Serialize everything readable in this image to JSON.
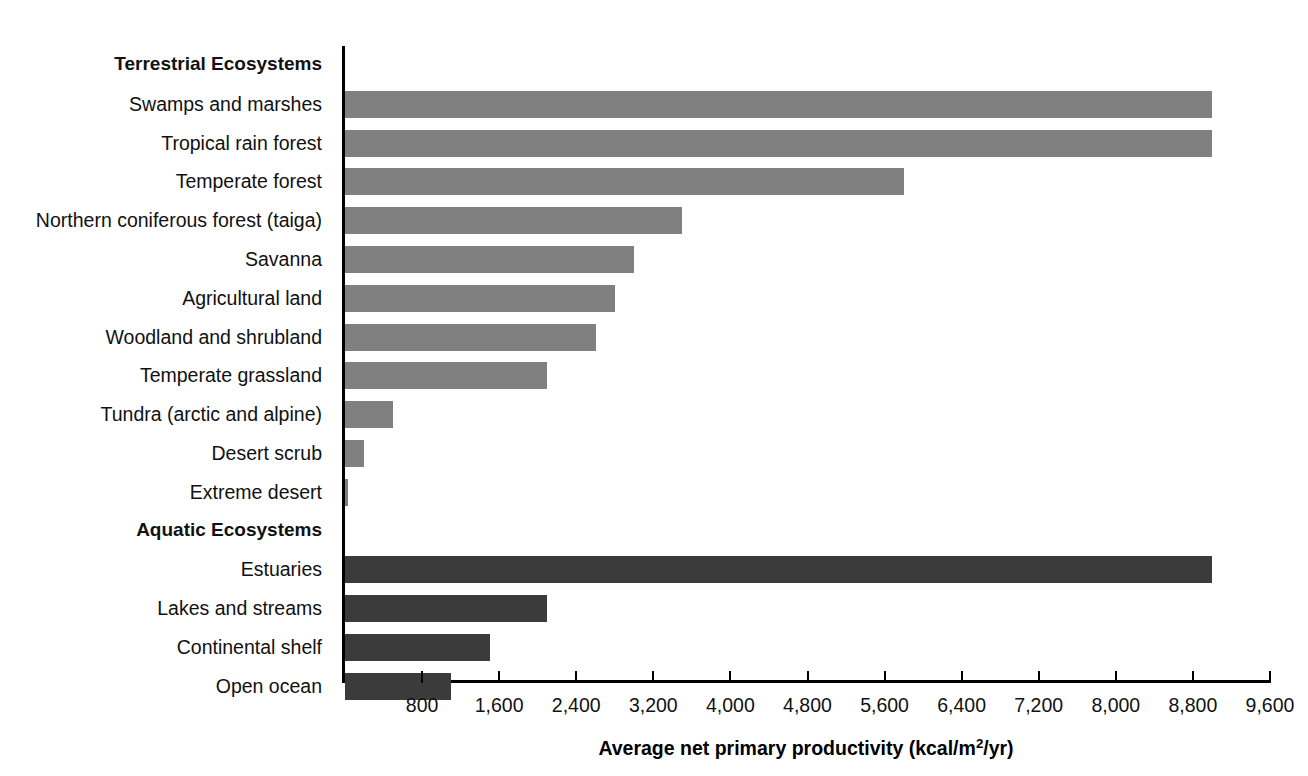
{
  "chart_data": {
    "type": "bar",
    "orientation": "horizontal",
    "title": "",
    "xlabel": "Average net primary productivity (kcal/m2/yr)",
    "xlabel_parts": {
      "pre": "Average net primary productivity (kcal/m",
      "sup": "2",
      "post": "/yr)"
    },
    "ylabel": "",
    "xlim": [
      0,
      9600
    ],
    "grid": false,
    "legend": false,
    "tick_labels": [
      "800",
      "1,600",
      "2,400",
      "3,200",
      "4,000",
      "4,800",
      "5,600",
      "6,400",
      "7,200",
      "8,000",
      "8,800",
      "9,600"
    ],
    "tick_values": [
      800,
      1600,
      2400,
      3200,
      4000,
      4800,
      5600,
      6400,
      7200,
      8000,
      8800,
      9600
    ],
    "groups": [
      {
        "name": "Terrestrial Ecosystems",
        "color": "#808080",
        "categories": [
          "Swamps and marshes",
          "Tropical rain forest",
          "Temperate forest",
          "Northern coniferous forest (taiga)",
          "Savanna",
          "Agricultural land",
          "Woodland and shrubland",
          "Temperate grassland",
          "Tundra (arctic and alpine)",
          "Desert scrub",
          "Extreme desert"
        ],
        "values": [
          9000,
          9000,
          5800,
          3500,
          3000,
          2800,
          2600,
          2100,
          500,
          200,
          30
        ]
      },
      {
        "name": "Aquatic Ecosystems",
        "color": "#3b3b3b",
        "categories": [
          "Estuaries",
          "Lakes and streams",
          "Continental shelf",
          "Open ocean"
        ],
        "values": [
          9000,
          2100,
          1500,
          1100
        ]
      }
    ],
    "rows": [
      {
        "label": "Terrestrial Ecosystems",
        "heading": true
      },
      {
        "label": "Swamps and marshes",
        "value": 9000,
        "series": "terrestrial"
      },
      {
        "label": "Tropical rain forest",
        "value": 9000,
        "series": "terrestrial"
      },
      {
        "label": "Temperate forest",
        "value": 5800,
        "series": "terrestrial"
      },
      {
        "label": "Northern coniferous forest (taiga)",
        "value": 3500,
        "series": "terrestrial"
      },
      {
        "label": "Savanna",
        "value": 3000,
        "series": "terrestrial"
      },
      {
        "label": "Agricultural land",
        "value": 2800,
        "series": "terrestrial"
      },
      {
        "label": "Woodland and shrubland",
        "value": 2600,
        "series": "terrestrial"
      },
      {
        "label": "Temperate grassland",
        "value": 2100,
        "series": "terrestrial"
      },
      {
        "label": "Tundra (arctic and alpine)",
        "value": 500,
        "series": "terrestrial"
      },
      {
        "label": "Desert scrub",
        "value": 200,
        "series": "terrestrial"
      },
      {
        "label": "Extreme desert",
        "value": 30,
        "series": "terrestrial"
      },
      {
        "label": "Aquatic Ecosystems",
        "heading": true
      },
      {
        "label": "Estuaries",
        "value": 9000,
        "series": "aquatic"
      },
      {
        "label": "Lakes and streams",
        "value": 2100,
        "series": "aquatic"
      },
      {
        "label": "Continental shelf",
        "value": 1500,
        "series": "aquatic"
      },
      {
        "label": "Open ocean",
        "value": 1100,
        "series": "aquatic"
      }
    ]
  },
  "colors": {
    "terrestrial_bar": "#808080",
    "aquatic_bar": "#3b3b3b",
    "axis": "#000000",
    "background": "#ffffff"
  }
}
